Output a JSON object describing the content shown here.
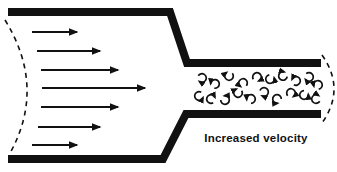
{
  "diagram": {
    "label": "Increased velocity",
    "colors": {
      "ink": "#111111",
      "background": "#ffffff"
    },
    "laminar_arrows": [
      {
        "x1": 32,
        "y": 32,
        "x2": 77
      },
      {
        "x1": 37,
        "y": 51,
        "x2": 100
      },
      {
        "x1": 41,
        "y": 70,
        "x2": 118
      },
      {
        "x1": 42,
        "y": 88,
        "x2": 145
      },
      {
        "x1": 41,
        "y": 107,
        "x2": 118
      },
      {
        "x1": 38,
        "y": 127,
        "x2": 100
      },
      {
        "x1": 32,
        "y": 145,
        "x2": 77
      }
    ],
    "turbulence_swirls": [
      {
        "x": 202,
        "y": 78,
        "rot": 210,
        "dir": 1
      },
      {
        "x": 215,
        "y": 84,
        "rot": 100,
        "dir": 0
      },
      {
        "x": 229,
        "y": 76,
        "rot": 320,
        "dir": 1
      },
      {
        "x": 243,
        "y": 83,
        "rot": 40,
        "dir": 0
      },
      {
        "x": 257,
        "y": 77,
        "rot": 150,
        "dir": 1
      },
      {
        "x": 270,
        "y": 79,
        "rot": 260,
        "dir": 0
      },
      {
        "x": 283,
        "y": 76,
        "rot": 10,
        "dir": 1
      },
      {
        "x": 296,
        "y": 81,
        "rot": 120,
        "dir": 0
      },
      {
        "x": 309,
        "y": 77,
        "rot": 230,
        "dir": 1
      },
      {
        "x": 318,
        "y": 85,
        "rot": 80,
        "dir": 0
      },
      {
        "x": 199,
        "y": 96,
        "rot": 300,
        "dir": 0
      },
      {
        "x": 211,
        "y": 99,
        "rot": 60,
        "dir": 1
      },
      {
        "x": 225,
        "y": 100,
        "rot": 180,
        "dir": 0
      },
      {
        "x": 238,
        "y": 93,
        "rot": 330,
        "dir": 1
      },
      {
        "x": 251,
        "y": 99,
        "rot": 90,
        "dir": 0
      },
      {
        "x": 264,
        "y": 92,
        "rot": 200,
        "dir": 1
      },
      {
        "x": 277,
        "y": 99,
        "rot": 0,
        "dir": 0
      },
      {
        "x": 291,
        "y": 93,
        "rot": 140,
        "dir": 1
      },
      {
        "x": 304,
        "y": 95,
        "rot": 270,
        "dir": 0
      },
      {
        "x": 316,
        "y": 99,
        "rot": 30,
        "dir": 1
      }
    ],
    "label_pos": {
      "x": 256,
      "y": 142
    }
  }
}
